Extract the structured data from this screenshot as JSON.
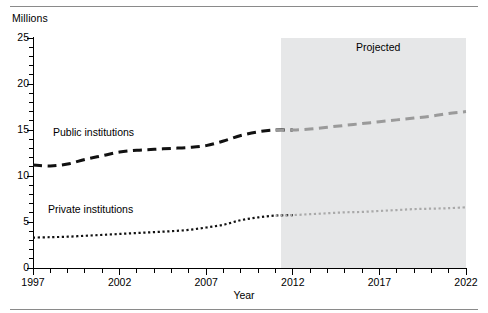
{
  "figure": {
    "y_axis_unit_label": "Millions",
    "x_axis_title": "Year",
    "band_label": "Projected"
  },
  "chart_data": {
    "type": "line",
    "title": "",
    "subtitle": "",
    "xlabel": "Year",
    "ylabel": "Millions",
    "xlim": [
      1997,
      2022
    ],
    "ylim": [
      0,
      25
    ],
    "grid": false,
    "legend_position": "inline-annotations",
    "x_tick_labels": [
      "1997",
      "2002",
      "2007",
      "2012",
      "2017",
      "2022"
    ],
    "x_tick_values": [
      1997,
      2002,
      2007,
      2012,
      2017,
      2022
    ],
    "x_minor_tick_interval": 1,
    "y_tick_labels": [
      "0",
      "5",
      "10",
      "15",
      "20",
      "25"
    ],
    "y_tick_values": [
      0,
      5,
      10,
      15,
      20,
      25
    ],
    "y_minor_tick_interval": 1,
    "annotations": [
      {
        "text": "Projected",
        "x": 2019,
        "y": 23.5
      },
      {
        "text": "Public institutions",
        "x": 1999.5,
        "y": 15.4
      },
      {
        "text": "Private institutions",
        "x": 1999,
        "y": 7.1
      }
    ],
    "shaded_region": {
      "label": "Projected",
      "x_start": 2011.3,
      "x_end": 2022,
      "color": "#e6e7e8"
    },
    "x": [
      1997,
      1998,
      1999,
      2000,
      2001,
      2002,
      2003,
      2004,
      2005,
      2006,
      2007,
      2008,
      2009,
      2010,
      2011,
      2012,
      2013,
      2014,
      2015,
      2016,
      2017,
      2018,
      2019,
      2020,
      2021,
      2022
    ],
    "series": [
      {
        "name": "Public institutions",
        "color_actual": "#111111",
        "color_projected": "#9a9a9a",
        "style": "dashed",
        "values": [
          11.2,
          11.1,
          11.3,
          11.8,
          12.2,
          12.6,
          12.8,
          12.9,
          13.0,
          13.1,
          13.3,
          13.8,
          14.4,
          14.8,
          15.0,
          15.0,
          15.1,
          15.3,
          15.5,
          15.7,
          15.9,
          16.1,
          16.3,
          16.5,
          16.8,
          17.0
        ]
      },
      {
        "name": "Private institutions",
        "color_actual": "#111111",
        "color_projected": "#a9a9a9",
        "style": "dotted",
        "values": [
          3.3,
          3.35,
          3.4,
          3.5,
          3.6,
          3.7,
          3.8,
          3.9,
          4.0,
          4.15,
          4.4,
          4.7,
          5.2,
          5.5,
          5.7,
          5.75,
          5.85,
          5.95,
          6.05,
          6.1,
          6.2,
          6.3,
          6.4,
          6.45,
          6.5,
          6.6
        ]
      }
    ]
  }
}
